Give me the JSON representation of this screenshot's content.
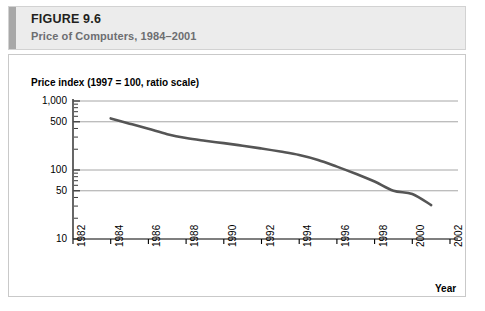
{
  "figure": {
    "number_prefix": "F",
    "number_rest": "IGURE",
    "number_full": "FIGURE 9.6",
    "number_value": "9.6",
    "subtitle": "Price of Computers, 1984–2001"
  },
  "colors": {
    "header_background": "#ececec",
    "header_accent": "#a8a8a8",
    "panel_border": "#c9c9c9",
    "line": "#555555",
    "gridline": "#a6a6a6",
    "axis": "#000000",
    "subtitle_text": "#6d6e71"
  },
  "chart_data": {
    "type": "line",
    "title": "",
    "ylabel": "Price index (1997 = 100, ratio scale)",
    "xlabel": "Year",
    "yscale": "log",
    "ylim": [
      10,
      1000
    ],
    "xlim": [
      1982,
      2002
    ],
    "grid": true,
    "legend": null,
    "yticks": [
      {
        "value": 1000,
        "label": "1,000",
        "gridline": true
      },
      {
        "value": 500,
        "label": "500",
        "gridline": true
      },
      {
        "value": 100,
        "label": "100",
        "gridline": true
      },
      {
        "value": 50,
        "label": "50",
        "gridline": true
      },
      {
        "value": 10,
        "label": "10",
        "gridline": false
      }
    ],
    "xticks": [
      {
        "value": 1982,
        "label": "1982"
      },
      {
        "value": 1984,
        "label": "1984"
      },
      {
        "value": 1986,
        "label": "1986"
      },
      {
        "value": 1988,
        "label": "1988"
      },
      {
        "value": 1990,
        "label": "1990"
      },
      {
        "value": 1992,
        "label": "1992"
      },
      {
        "value": 1994,
        "label": "1994"
      },
      {
        "value": 1996,
        "label": "1996"
      },
      {
        "value": 1998,
        "label": "1998"
      },
      {
        "value": 2000,
        "label": "2000"
      },
      {
        "value": 2002,
        "label": "2002"
      }
    ],
    "series": [
      {
        "name": "Price index of computers",
        "color": "#555555",
        "x": [
          1984,
          1985,
          1986,
          1987,
          1988,
          1989,
          1990,
          1991,
          1992,
          1993,
          1994,
          1995,
          1996,
          1997,
          1998,
          1999,
          2000,
          2001
        ],
        "values": [
          560,
          470,
          395,
          330,
          290,
          265,
          245,
          225,
          205,
          185,
          165,
          140,
          112,
          88,
          68,
          50,
          45,
          31
        ]
      }
    ]
  }
}
